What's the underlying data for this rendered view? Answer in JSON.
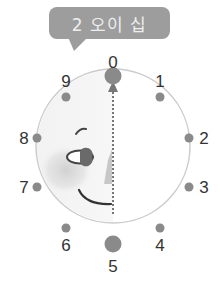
{
  "callout": {
    "text": "2 오이 십",
    "color": "#9d9d9d",
    "text_color": "#eeeeee"
  },
  "dial": {
    "labels": [
      "0",
      "1",
      "2",
      "3",
      "4",
      "5",
      "6",
      "7",
      "8",
      "9"
    ],
    "highlighted": [
      "0",
      "5"
    ],
    "dot_color": "#8a8a8a",
    "ring_color": "#cccccc",
    "arrow": {
      "from": "5",
      "to": "0",
      "style": "dotted"
    }
  }
}
